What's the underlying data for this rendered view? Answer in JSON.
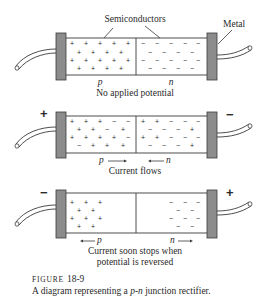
{
  "figure": {
    "number_prefix": "FIGURE",
    "number": "18-9",
    "caption_prefix": "A diagram representing a ",
    "caption_italic": "p-n",
    "caption_suffix": " junction rectifier."
  },
  "labels": {
    "semiconductors": "Semiconductors",
    "metal": "Metal",
    "p": "p",
    "n": "n"
  },
  "panels": [
    {
      "caption": "No applied potential",
      "left_terminal": "",
      "right_terminal": "",
      "p_arrow": "none",
      "n_arrow": "none"
    },
    {
      "caption": "Current flows",
      "left_terminal": "+",
      "right_terminal": "−",
      "p_arrow": "right",
      "n_arrow": "left"
    },
    {
      "caption_line1": "Current soon stops when",
      "caption_line2": "potential is reversed",
      "left_terminal": "−",
      "right_terminal": "+",
      "p_arrow": "left",
      "n_arrow": "right"
    }
  ],
  "colors": {
    "metal_fill": "#8c8c8c",
    "line": "#3a3a3a",
    "background": "#ffffff"
  }
}
